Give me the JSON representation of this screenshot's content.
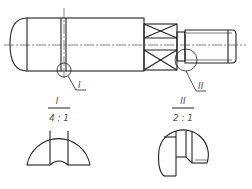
{
  "drawing": {
    "type": "shaft technical drawing with detail views",
    "line_color": "#222222",
    "detail_callouts": [
      {
        "id": "I",
        "label": "I"
      },
      {
        "id": "II",
        "label": "II"
      }
    ],
    "detail_views": [
      {
        "label": "I",
        "scale": "4 : 1"
      },
      {
        "label": "II",
        "scale": "2 : 1"
      }
    ]
  }
}
